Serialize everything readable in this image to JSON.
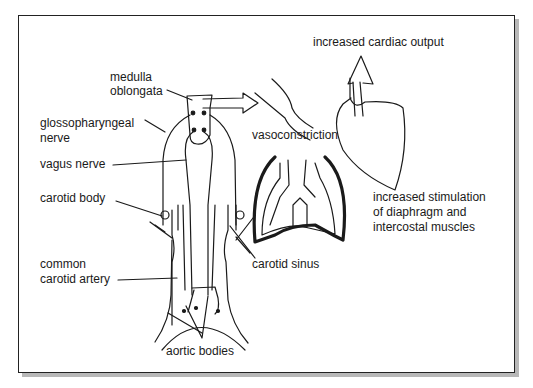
{
  "diagram": {
    "title": "",
    "labels": {
      "medulla_line1": "medulla",
      "medulla_line2": "oblongata",
      "glosso_line1": "glossopharyngeal",
      "glosso_line2": "nerve",
      "vagus": "vagus nerve",
      "carotid_body": "carotid body",
      "common_line1": "common",
      "common_line2": "carotid artery",
      "aortic_bodies": "aortic bodies",
      "carotid_sinus": "carotid sinus",
      "vasoconstriction": "vasoconstriction",
      "cardiac_output": "increased cardiac output",
      "stim_line1": "increased stimulation",
      "stim_line2": "of diaphragm and",
      "stim_line3": "intercostal muscles"
    },
    "colors": {
      "line": "#1a1a1a",
      "frame_shadow": "#b8b8b8",
      "background": "#ffffff"
    }
  }
}
